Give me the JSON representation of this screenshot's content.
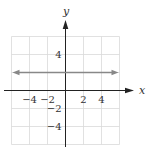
{
  "chart_data": {
    "type": "line",
    "title": "",
    "xlabel": "x",
    "ylabel": "y",
    "xlim": [
      -6,
      6
    ],
    "ylim": [
      -6,
      6
    ],
    "grid": true,
    "grid_step": 2,
    "x_ticks": [
      {
        "value": -4,
        "label": "−4"
      },
      {
        "value": -2,
        "label": "−2"
      },
      {
        "value": 2,
        "label": "2"
      },
      {
        "value": 4,
        "label": "4"
      }
    ],
    "y_ticks": [
      {
        "value": 4,
        "label": "4"
      },
      {
        "value": -2,
        "label": "−2"
      },
      {
        "value": -4,
        "label": "−4"
      }
    ],
    "series": [
      {
        "name": "y = 2",
        "equation": "y = 2",
        "x": [
          -6,
          6
        ],
        "y": [
          2,
          2
        ],
        "arrows": "both",
        "color": "#888888"
      }
    ]
  },
  "colors": {
    "axis": "#222222",
    "grid": "#d9d9d9",
    "line": "#888888"
  }
}
